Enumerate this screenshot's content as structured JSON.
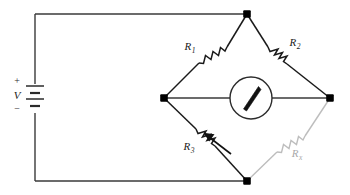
{
  "figure": {
    "kind": "circuit-schematic",
    "name": "wheatstone-bridge",
    "width": 350,
    "height": 195,
    "background": "#ffffff"
  },
  "colors": {
    "wire": "#3a3a3a",
    "wire_dark": "#1a1a1a",
    "node": "#000000",
    "faint": "#bdbdbd",
    "faint_text": "#a8a8a8",
    "label": "#1a1a1a",
    "meter_outline": "#2b2b2b",
    "needle": "#111111"
  },
  "source": {
    "name": "dc-voltage-source",
    "symbol": "battery",
    "cells": 2,
    "label": "V",
    "plus_sign": "+",
    "minus_sign": "−"
  },
  "meter": {
    "name": "galvanometer",
    "symbol": "circle-with-needle",
    "label": "",
    "needle_direction": "up-right"
  },
  "components": [
    {
      "id": "R1",
      "label": "R",
      "subscript": "1",
      "type": "resistor",
      "variable": false,
      "faint": false,
      "arm": "top-left"
    },
    {
      "id": "R2",
      "label": "R",
      "subscript": "2",
      "type": "resistor",
      "variable": false,
      "faint": false,
      "arm": "top-right"
    },
    {
      "id": "R3",
      "label": "R",
      "subscript": "3",
      "type": "resistor",
      "variable": true,
      "faint": false,
      "arm": "bottom-left"
    },
    {
      "id": "Rx",
      "label": "R",
      "subscript": "x",
      "type": "resistor",
      "variable": false,
      "faint": true,
      "arm": "bottom-right"
    }
  ],
  "nodes": [
    {
      "id": "top",
      "name": "bridge-node-top",
      "x": 247,
      "y": 14
    },
    {
      "id": "left",
      "name": "bridge-node-left",
      "x": 164,
      "y": 98
    },
    {
      "id": "right",
      "name": "bridge-node-right",
      "x": 330,
      "y": 98
    },
    {
      "id": "bottom",
      "name": "bridge-node-bottom",
      "x": 247,
      "y": 181
    }
  ]
}
